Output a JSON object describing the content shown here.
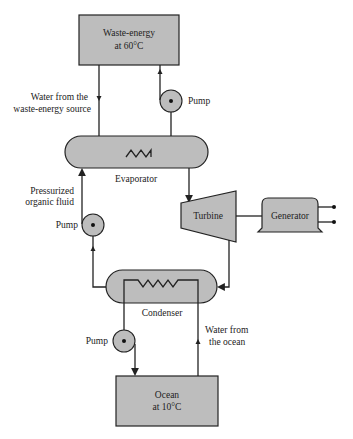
{
  "diagram": {
    "type": "process-flow",
    "colors": {
      "fill": "#bdbdbd",
      "stroke": "#222222",
      "background": "#ffffff"
    },
    "nodes": {
      "waste_energy": {
        "line1": "Waste-energy",
        "line2": "at 60°C"
      },
      "evaporator": {
        "label": "Evaporator"
      },
      "turbine": {
        "label": "Turbine"
      },
      "generator": {
        "label": "Generator"
      },
      "condenser": {
        "label": "Condenser"
      },
      "ocean": {
        "line1": "Ocean",
        "line2": "at 10°C"
      },
      "pump_top": {
        "label": "Pump"
      },
      "pump_mid": {
        "label": "Pump"
      },
      "pump_bottom": {
        "label": "Pump"
      }
    },
    "annotations": {
      "waste_water": {
        "line1": "Water from the",
        "line2": "waste-energy source"
      },
      "organic_fluid": {
        "line1": "Pressurized",
        "line2": "organic fluid"
      },
      "ocean_water": {
        "line1": "Water from",
        "line2": "the ocean"
      }
    },
    "edges": [
      {
        "from": "Waste-energy at 60°C",
        "to": "Evaporator",
        "label": "Water from the waste-energy source"
      },
      {
        "from": "Evaporator",
        "to": "Pump (top)"
      },
      {
        "from": "Pump (top)",
        "to": "Waste-energy at 60°C"
      },
      {
        "from": "Evaporator",
        "to": "Turbine"
      },
      {
        "from": "Turbine",
        "to": "Generator"
      },
      {
        "from": "Turbine",
        "to": "Condenser"
      },
      {
        "from": "Condenser",
        "to": "Pump (middle)"
      },
      {
        "from": "Pump (middle)",
        "to": "Evaporator",
        "label": "Pressurized organic fluid"
      },
      {
        "from": "Ocean at 10°C",
        "to": "Condenser",
        "label": "Water from the ocean"
      },
      {
        "from": "Condenser",
        "to": "Pump (bottom)"
      },
      {
        "from": "Pump (bottom)",
        "to": "Ocean at 10°C"
      }
    ]
  }
}
